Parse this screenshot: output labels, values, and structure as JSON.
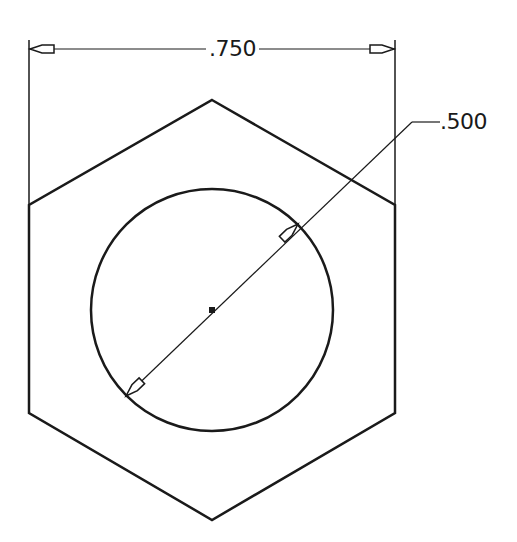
{
  "drawing": {
    "title": "Hexagon nut top view with bore",
    "stroke_color": "#1a1a1a",
    "background": "#ffffff",
    "hexagon": {
      "points": [
        [
          212,
          100
        ],
        [
          395,
          205
        ],
        [
          395,
          413
        ],
        [
          212,
          520
        ],
        [
          29,
          413
        ],
        [
          29,
          205
        ]
      ]
    },
    "circle": {
      "cx": 212,
      "cy": 310,
      "r": 121
    },
    "center_point": {
      "x": 212,
      "y": 310
    }
  },
  "dimensions": {
    "width": {
      "label": ".750",
      "description": "Across-corners width dimension",
      "extension_left_x": 29,
      "extension_right_x": 395,
      "dimension_line_y": 49
    },
    "diameter": {
      "label": ".500",
      "description": "Bore diameter dimension with leader"
    }
  }
}
